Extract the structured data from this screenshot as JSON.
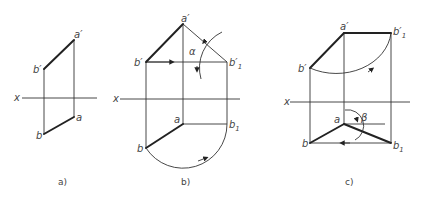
{
  "figure": {
    "panels": [
      {
        "id": "a",
        "caption": "a)",
        "labels": {
          "x": "x",
          "a_prime": "a′",
          "b_prime": "b′",
          "a": "a",
          "b": "b"
        }
      },
      {
        "id": "b",
        "caption": "b)",
        "labels": {
          "x": "x",
          "a_prime": "a′",
          "b_prime": "b′",
          "b1_prime": "b′",
          "b1_prime_sub": "1",
          "a": "a",
          "b": "b",
          "b1": "b",
          "b1_sub": "1",
          "angle": "α"
        }
      },
      {
        "id": "c",
        "caption": "c)",
        "labels": {
          "x": "x",
          "a_prime": "a′",
          "b_prime": "b′",
          "b1_prime": "b′",
          "b1_prime_sub": "1",
          "a": "a",
          "b": "b",
          "b1": "b",
          "b1_sub": "1",
          "angle": "β"
        }
      }
    ]
  }
}
